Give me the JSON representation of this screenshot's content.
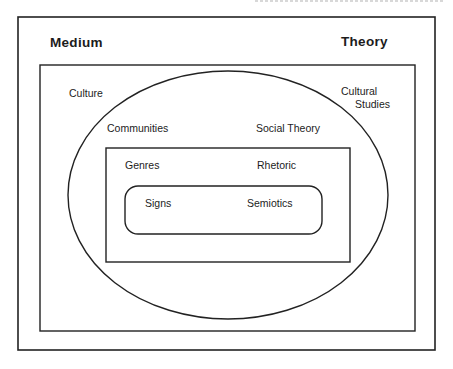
{
  "diagram": {
    "title_left": "Medium",
    "title_right": "Theory",
    "levels": [
      {
        "shape": "rectangle",
        "medium": "Culture",
        "theory_line1": "Cultural",
        "theory_line2": "Studies"
      },
      {
        "shape": "ellipse",
        "medium": "Communities",
        "theory": "Social Theory"
      },
      {
        "shape": "rectangle",
        "medium": "Genres",
        "theory": "Rhetoric"
      },
      {
        "shape": "rounded-rectangle",
        "medium": "Signs",
        "theory": "Semiotics"
      }
    ]
  },
  "colors": {
    "stroke": "#222222",
    "text": "#1c1c1c",
    "background": "#ffffff"
  }
}
